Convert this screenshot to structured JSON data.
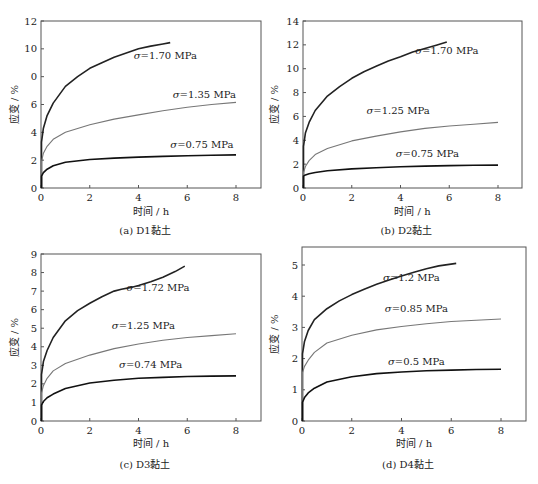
{
  "chart_data": [
    {
      "id": "a",
      "type": "line",
      "caption": "(a)  D1黏土",
      "xlabel": "时间 / h",
      "ylabel": "应变 / %",
      "xlim": [
        0,
        9
      ],
      "ylim": [
        0,
        12
      ],
      "xticks": [
        "0",
        "2",
        "4",
        "6",
        "8"
      ],
      "yticks": [
        "0",
        "2",
        "4",
        "6",
        "0",
        "10",
        "12"
      ],
      "grid": false,
      "series": [
        {
          "name": "σ=1.70 MPa",
          "color": "#222222",
          "label_at": [
            5.1,
            9.3
          ],
          "x": [
            0,
            0.02,
            0.1,
            0.25,
            0.5,
            1.0,
            1.5,
            2.0,
            2.5,
            3.0,
            3.5,
            4.0,
            4.5,
            5.0,
            5.3
          ],
          "y": [
            0,
            3.3,
            4.3,
            5.2,
            6.1,
            7.3,
            8.0,
            8.6,
            9.0,
            9.4,
            9.7,
            10.0,
            10.2,
            10.35,
            10.45
          ]
        },
        {
          "name": "σ=1.35 MPa",
          "color": "#777777",
          "label_at": [
            6.7,
            6.5
          ],
          "x": [
            0,
            0.02,
            0.1,
            0.25,
            0.5,
            1.0,
            2.0,
            3.0,
            4.0,
            5.0,
            6.0,
            7.0,
            8.0
          ],
          "y": [
            0,
            1.9,
            2.5,
            3.0,
            3.5,
            4.0,
            4.55,
            4.95,
            5.25,
            5.55,
            5.8,
            6.0,
            6.15
          ]
        },
        {
          "name": "σ=0.75 MPa",
          "color": "#111111",
          "label_at": [
            6.6,
            2.9
          ],
          "x": [
            0,
            0.02,
            0.1,
            0.25,
            0.5,
            1.0,
            2.0,
            3.0,
            4.0,
            5.0,
            6.0,
            7.0,
            8.0
          ],
          "y": [
            0,
            0.85,
            1.1,
            1.35,
            1.6,
            1.85,
            2.05,
            2.15,
            2.22,
            2.27,
            2.32,
            2.35,
            2.38
          ]
        }
      ]
    },
    {
      "id": "b",
      "type": "line",
      "caption": "(b) D2黏土",
      "xlabel": "时间 / h",
      "ylabel": "应变 / %",
      "xlim": [
        0,
        9
      ],
      "ylim": [
        0,
        14
      ],
      "xticks": [
        "0",
        "2",
        "4",
        "6",
        "8"
      ],
      "yticks": [
        "0",
        "2",
        "4",
        "6",
        "8",
        "10",
        "12",
        "14"
      ],
      "grid": false,
      "series": [
        {
          "name": "σ=1.70 MPa",
          "color": "#222222",
          "label_at": [
            5.9,
            11.2
          ],
          "x": [
            0,
            0.02,
            0.1,
            0.25,
            0.5,
            1.0,
            1.5,
            2.0,
            2.5,
            3.0,
            3.5,
            4.0,
            4.5,
            5.0,
            5.5,
            5.9
          ],
          "y": [
            0,
            3.5,
            4.6,
            5.5,
            6.5,
            7.7,
            8.5,
            9.2,
            9.75,
            10.2,
            10.65,
            11.0,
            11.4,
            11.7,
            12.0,
            12.25
          ]
        },
        {
          "name": "σ=1.25 MPa",
          "color": "#777777",
          "label_at": [
            3.9,
            6.2
          ],
          "x": [
            0,
            0.02,
            0.1,
            0.25,
            0.5,
            1.0,
            2.0,
            3.0,
            4.0,
            5.0,
            6.0,
            7.0,
            8.0
          ],
          "y": [
            0,
            1.3,
            1.8,
            2.3,
            2.8,
            3.3,
            3.95,
            4.35,
            4.7,
            5.0,
            5.2,
            5.35,
            5.5
          ]
        },
        {
          "name": "σ=0.75 MPa",
          "color": "#111111",
          "label_at": [
            5.1,
            2.6
          ],
          "x": [
            0,
            0.02,
            0.1,
            0.25,
            0.5,
            1.0,
            2.0,
            3.0,
            4.0,
            5.0,
            6.0,
            7.0,
            8.0
          ],
          "y": [
            0,
            1.0,
            1.1,
            1.2,
            1.3,
            1.45,
            1.6,
            1.7,
            1.78,
            1.84,
            1.88,
            1.9,
            1.92
          ]
        }
      ]
    },
    {
      "id": "c",
      "type": "line",
      "caption": "(c) D3黏土",
      "xlabel": "时间 / h",
      "ylabel": "应变 / %",
      "xlim": [
        0,
        9
      ],
      "ylim": [
        0,
        9
      ],
      "xticks": [
        "0",
        "2",
        "4",
        "6",
        "8"
      ],
      "yticks": [
        "0",
        "1",
        "2",
        "3",
        "4",
        "5",
        "6",
        "7",
        "8",
        "9"
      ],
      "grid": false,
      "series": [
        {
          "name": "σ=1.72 MPa",
          "color": "#222222",
          "label_at": [
            4.8,
            7.0
          ],
          "x": [
            0,
            0.02,
            0.1,
            0.25,
            0.5,
            1.0,
            1.5,
            2.0,
            2.5,
            3.0,
            3.3,
            3.7,
            4.0,
            4.5,
            5.0,
            5.5,
            5.9
          ],
          "y": [
            0,
            2.5,
            3.2,
            3.8,
            4.5,
            5.4,
            5.95,
            6.35,
            6.7,
            7.0,
            7.1,
            7.2,
            7.3,
            7.5,
            7.75,
            8.05,
            8.35
          ]
        },
        {
          "name": "σ=1.25 MPa",
          "color": "#777777",
          "label_at": [
            4.2,
            4.95
          ],
          "x": [
            0,
            0.02,
            0.1,
            0.25,
            0.5,
            1.0,
            2.0,
            3.0,
            4.0,
            5.0,
            6.0,
            7.0,
            8.0
          ],
          "y": [
            0,
            1.5,
            1.9,
            2.3,
            2.7,
            3.1,
            3.55,
            3.9,
            4.15,
            4.35,
            4.5,
            4.6,
            4.7
          ]
        },
        {
          "name": "σ=0.74 MPa",
          "color": "#111111",
          "label_at": [
            4.5,
            2.85
          ],
          "x": [
            0,
            0.02,
            0.1,
            0.25,
            0.5,
            1.0,
            2.0,
            3.0,
            4.0,
            5.0,
            6.0,
            7.0,
            8.0
          ],
          "y": [
            0,
            0.85,
            1.05,
            1.25,
            1.45,
            1.75,
            2.05,
            2.2,
            2.3,
            2.35,
            2.4,
            2.42,
            2.43
          ]
        }
      ]
    },
    {
      "id": "d",
      "type": "line",
      "caption": "(d) D4黏土",
      "xlabel": "时间 / h",
      "ylabel": "应变 / %",
      "xlim": [
        0,
        9
      ],
      "ylim": [
        0,
        5.5
      ],
      "xticks": [
        "0",
        "2",
        "4",
        "6",
        "8"
      ],
      "yticks": [
        "0",
        "1",
        "2",
        "3",
        "4",
        "5"
      ],
      "grid": false,
      "series": [
        {
          "name": "σ=1.2 MPa",
          "color": "#222222",
          "label_at": [
            4.4,
            4.5
          ],
          "x": [
            0,
            0.02,
            0.1,
            0.25,
            0.5,
            1.0,
            1.5,
            2.0,
            2.5,
            3.0,
            3.5,
            4.0,
            4.5,
            5.0,
            5.5,
            6.2
          ],
          "y": [
            0,
            2.15,
            2.55,
            2.9,
            3.25,
            3.6,
            3.85,
            4.05,
            4.22,
            4.38,
            4.52,
            4.65,
            4.77,
            4.88,
            4.97,
            5.05
          ]
        },
        {
          "name": "σ=0.85 MPa",
          "color": "#777777",
          "label_at": [
            4.6,
            3.5
          ],
          "x": [
            0,
            0.02,
            0.1,
            0.25,
            0.5,
            1.0,
            2.0,
            3.0,
            4.0,
            5.0,
            6.0,
            7.0,
            8.0
          ],
          "y": [
            0,
            1.55,
            1.75,
            1.95,
            2.2,
            2.5,
            2.75,
            2.92,
            3.03,
            3.12,
            3.19,
            3.23,
            3.27
          ]
        },
        {
          "name": "σ=0.5 MPa",
          "color": "#111111",
          "label_at": [
            4.6,
            1.8
          ],
          "x": [
            0,
            0.02,
            0.1,
            0.25,
            0.5,
            1.0,
            2.0,
            3.0,
            4.0,
            5.0,
            6.0,
            7.0,
            8.0
          ],
          "y": [
            0,
            0.6,
            0.75,
            0.9,
            1.05,
            1.25,
            1.42,
            1.52,
            1.57,
            1.61,
            1.63,
            1.65,
            1.66
          ]
        }
      ]
    }
  ]
}
